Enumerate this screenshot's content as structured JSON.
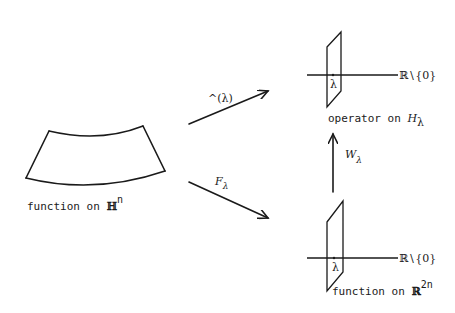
{
  "diagram": {
    "left_shape": {
      "label_prefix": "function on ",
      "label_space": "ℍ",
      "label_exp": "n"
    },
    "top_arrow": {
      "label": "^(λ)"
    },
    "bottom_arrow": {
      "label_main": "F",
      "label_sub": "λ"
    },
    "top_plane": {
      "axis_label": "ℝ∖{0}",
      "point_label": "λ",
      "caption_prefix": "operator on ",
      "caption_space": "H",
      "caption_sub": "λ"
    },
    "vertical_arrow": {
      "label_main": "W",
      "label_sub": "λ"
    },
    "bottom_plane": {
      "axis_label": "ℝ∖{0}",
      "point_label": "λ",
      "caption_prefix": "function on ",
      "caption_space": "ℝ",
      "caption_exp": "2n"
    }
  }
}
